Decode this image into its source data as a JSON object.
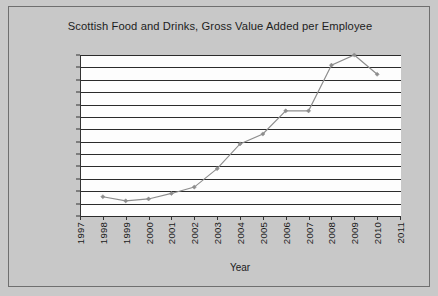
{
  "chart_data": {
    "type": "line",
    "title": "Scottish Food and Drinks, Gross Value Added per Employee",
    "xlabel": "Year",
    "ylabel": "",
    "categories": [
      1997,
      1998,
      1999,
      2000,
      2001,
      2002,
      2003,
      2004,
      2005,
      2006,
      2007,
      2008,
      2009,
      2010,
      2011
    ],
    "x_tick_labels": [
      "1997",
      "1998",
      "1999",
      "2000",
      "2001",
      "2002",
      "2003",
      "2004",
      "2005",
      "2006",
      "2007",
      "2008",
      "2009",
      "2010",
      "2011"
    ],
    "y_tick_labels": [
      "88,500",
      "84,000",
      "79,500",
      "75,000",
      "70,500",
      "66,000",
      "61,500",
      "57,000",
      "52,500",
      "48,000",
      "43,500",
      "39,000",
      "34,500",
      "30,000"
    ],
    "y_tick_values": [
      88500,
      84000,
      79500,
      75000,
      70500,
      66000,
      61500,
      57000,
      52500,
      48000,
      43500,
      39000,
      34500,
      30000
    ],
    "ylim": [
      30000,
      88500
    ],
    "y_step": 4500,
    "grid": true,
    "legend": false,
    "series": [
      {
        "name": "Gross Value Added per Employee",
        "x": [
          1998,
          1999,
          2000,
          2001,
          2002,
          2003,
          2004,
          2005,
          2006,
          2007,
          2008,
          2009,
          2010
        ],
        "values": [
          37000,
          35500,
          36200,
          38200,
          40500,
          47200,
          56200,
          59800,
          68200,
          68200,
          84800,
          88500,
          81500
        ],
        "color": "#8d8d8d",
        "marker": "diamond"
      }
    ]
  },
  "figure": {
    "background_color": "#c8c8c8",
    "plot_background_color": "#fdfdfd",
    "border_color": "#6f6f6f",
    "gridline_color": "#2b2b2b",
    "axis_color": "#333333"
  }
}
